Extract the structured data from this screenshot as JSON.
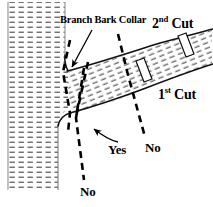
{
  "figure": {
    "colors": {
      "ink": "#000000",
      "background": "#ffffff",
      "hatch": "#555555",
      "outline": "#111111"
    }
  },
  "labels": {
    "branch_bark_collar": "Branch Bark Collar",
    "second_cut_number": "2",
    "second_cut_ordinal": "nd",
    "second_cut_word": "Cut",
    "first_cut_number": "1",
    "first_cut_ordinal": "st",
    "first_cut_word": "Cut",
    "yes": "Yes",
    "no_right": "No",
    "no_bottom": "No"
  },
  "parts": {
    "trunk": "tree-trunk",
    "branch": "tree-branch",
    "collar": "branch-bark-collar",
    "cut_band_first": "first-cut-band",
    "cut_band_second": "second-cut-band",
    "dashed_correct": "correct-cut-line",
    "dashed_flush": "flush-cut-line",
    "dashed_stub_near": "stub-cut-line-near",
    "dashed_stub_far": "stub-cut-line-far",
    "pointer_collar": "collar-pointer-arrow",
    "pointer_yes": "yes-pointer-arrow"
  }
}
